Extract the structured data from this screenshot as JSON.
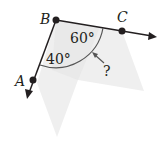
{
  "diagram": {
    "type": "geometry-angle-figure",
    "points": [
      {
        "id": "B",
        "label": "B",
        "x": 56,
        "y": 20
      },
      {
        "id": "C",
        "label": "C",
        "x": 122,
        "y": 31
      },
      {
        "id": "A",
        "label": "A",
        "x": 33,
        "y": 80
      }
    ],
    "rays": [
      {
        "from": "B",
        "through": "C",
        "label": "ray BC"
      },
      {
        "from": "B",
        "through": "A",
        "label": "ray BA"
      }
    ],
    "angles": {
      "upper": "60°",
      "lower": "40°",
      "unknown": "?"
    },
    "colors": {
      "ink": "#231f20",
      "shade": "#ececec"
    }
  }
}
